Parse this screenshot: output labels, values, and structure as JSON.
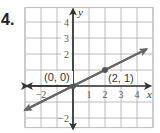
{
  "problem": {
    "number": "4."
  },
  "chart_data": {
    "type": "line",
    "title": "",
    "xlabel": "x",
    "ylabel": "y",
    "xlim": [
      -3,
      5
    ],
    "ylim": [
      -2.6,
      4.9
    ],
    "grid": true,
    "x_ticks": [
      {
        "value": -2,
        "label": "−2"
      },
      {
        "value": 1,
        "label": "1"
      },
      {
        "value": 2,
        "label": "2"
      },
      {
        "value": 3,
        "label": "3"
      },
      {
        "value": 4,
        "label": "4"
      }
    ],
    "y_ticks": [
      {
        "value": 4,
        "label": "4"
      },
      {
        "value": 3,
        "label": "3"
      },
      {
        "value": 2,
        "label": "2"
      },
      {
        "value": -2,
        "label": "−2"
      }
    ],
    "series": [
      {
        "name": "y = 0.5x",
        "equation": "y = 0.5x",
        "x": [
          -3,
          4.6
        ],
        "y": [
          -1.5,
          2.3
        ],
        "arrows": "both",
        "color": "#666666"
      }
    ],
    "points": [
      {
        "x": 0,
        "y": 0,
        "label": "(0, 0)"
      },
      {
        "x": 2,
        "y": 1,
        "label": "(2, 1)"
      }
    ],
    "colors": {
      "grid": "#bbbbbb",
      "axes": "#333333",
      "line": "#666666",
      "point": "#555555"
    }
  }
}
